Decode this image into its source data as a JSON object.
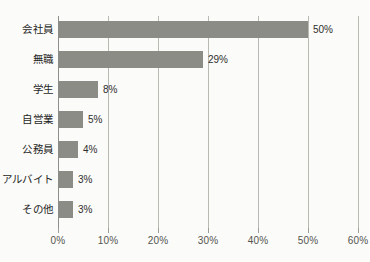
{
  "chart_data": {
    "type": "bar",
    "orientation": "horizontal",
    "title": "",
    "subtitle": "",
    "xlabel": "",
    "ylabel": "",
    "categories": [
      "会社員",
      "無職",
      "学生",
      "自営業",
      "公務員",
      "アルバイト",
      "その他"
    ],
    "values": [
      50,
      29,
      8,
      5,
      4,
      3,
      3
    ],
    "value_labels": [
      "50%",
      "29%",
      "8%",
      "5%",
      "4%",
      "3%",
      "3%"
    ],
    "xlim": [
      0,
      60
    ],
    "xticks": [
      0,
      10,
      20,
      30,
      40,
      50,
      60
    ],
    "xtick_labels": [
      "0%",
      "10%",
      "20%",
      "30%",
      "40%",
      "50%",
      "60%"
    ],
    "grid": "vertical",
    "legend": "none",
    "colors": {
      "bar": "#8c8c87",
      "gridline": "#b9b9b4",
      "axis": "#8f8f8a",
      "background": "#fbfbf9",
      "category_label": "#1f1f1e",
      "value_label": "#2e2e2c",
      "tick_label": "#55554f"
    }
  }
}
